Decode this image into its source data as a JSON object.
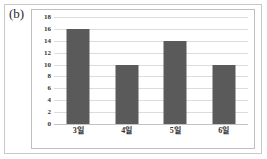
{
  "figure": {
    "panel_label": "(b)"
  },
  "chart_data": {
    "type": "bar",
    "title": "",
    "subtitle": "",
    "xlabel": "",
    "ylabel": "",
    "categories": [
      "3일",
      "4일",
      "5일",
      "6일"
    ],
    "values": [
      16,
      10,
      14,
      10
    ],
    "ylim": [
      0,
      18
    ],
    "ytick_step": 2,
    "yticks": [
      18,
      16,
      14,
      12,
      10,
      8,
      6,
      4,
      2,
      0
    ],
    "ytick_labels": [
      "18",
      "16",
      "14",
      "12",
      "10",
      "8",
      "6",
      "4",
      "2",
      "0"
    ],
    "grid": true,
    "grid_axis": "y",
    "legend": false,
    "legend_position": "none",
    "series": [
      {
        "name": "",
        "values": [
          16,
          10,
          14,
          10
        ]
      }
    ],
    "colors": {
      "bar_fill": "#5a5a5a",
      "gridline": "#dcdcdc",
      "axis_line": "#c2c2c2",
      "plot_background": "#ffffff",
      "plot_border": "#bfbfbf",
      "figure_border": "#c9c9c9",
      "tick_label": "#333333",
      "panel_label": "#2a2a2a"
    }
  }
}
